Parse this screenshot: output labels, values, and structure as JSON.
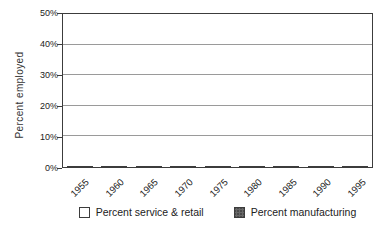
{
  "chart_data": {
    "type": "bar",
    "title": "",
    "ylabel": "Percent employed",
    "xlabel": "",
    "categories": [
      "1955",
      "1960",
      "1965",
      "1970",
      "1975",
      "1980",
      "1985",
      "1990",
      "1995"
    ],
    "series": [
      {
        "name": "Percent service & retail",
        "key": "service",
        "values": [
          27.5,
          29,
          30,
          32,
          34,
          36,
          40,
          43,
          45.5
        ],
        "fill": "#fefefe"
      },
      {
        "name": "Percent manufacturing",
        "key": "mfg",
        "values": [
          33.5,
          31,
          30,
          27,
          23.5,
          22.5,
          19.5,
          17.5,
          15.5
        ],
        "fill": "#4b4b4b"
      }
    ],
    "ylim": [
      0,
      50
    ],
    "ytick_step": 10,
    "ytick_labels": [
      "0%",
      "10%",
      "20%",
      "30%",
      "40%",
      "50%"
    ],
    "grid": true,
    "legend_position": "bottom"
  },
  "colors": {
    "axis": "#3c3c3c",
    "gridline": "#9a9a9a",
    "text": "#222222",
    "bar_outline": "#3c3c3c",
    "service_fill": "#fefefe",
    "manufacturing_fill": "#4b4b4b"
  }
}
